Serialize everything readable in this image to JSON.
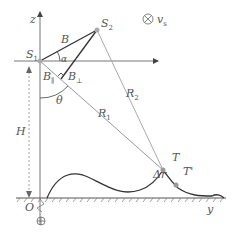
{
  "labels": {
    "z_axis": "z",
    "y_axis": "y",
    "origin": "O",
    "s1": "S",
    "s1_sub": "1",
    "s2": "S",
    "s2_sub": "2",
    "baseline": "B",
    "alpha": "α",
    "b_par": "B",
    "b_par_sub": "∥",
    "b_perp": "B",
    "b_perp_sub": "⊥",
    "theta": "θ",
    "r1": "R",
    "r1_sub": "1",
    "r2": "R",
    "r2_sub": "2",
    "height": "H",
    "target": "T",
    "target_prime": "T'",
    "delta_r": "Δr",
    "velocity": "v",
    "velocity_sub": "s"
  },
  "colors": {
    "line_dark": "#333333",
    "line_gray": "#999999",
    "point": "#aaaaaa",
    "text": "#555555"
  }
}
